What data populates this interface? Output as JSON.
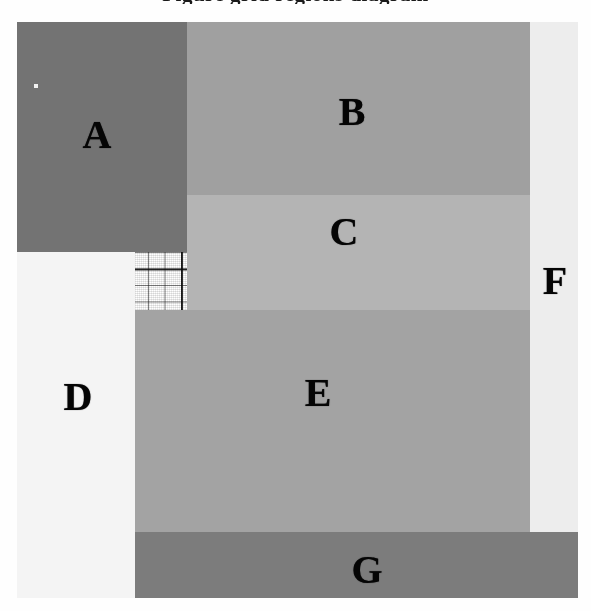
{
  "figure": {
    "clipped_caption_above": "Figure grid regions diagram",
    "plate": {
      "x": 17,
      "y": 22,
      "width": 561,
      "height": 576,
      "grid_cell_px": 16.5,
      "grid_major_every": 5,
      "background": "#ffffff"
    }
  },
  "legend_note": "",
  "chart_data": {
    "type": "heatmap",
    "title": "",
    "xlabel": "",
    "ylabel": "",
    "grid": true,
    "legend_position": "none",
    "xlim": [
      0,
      561
    ],
    "ylim": [
      0,
      576
    ],
    "regions": [
      {
        "label": "A",
        "color": "#737373",
        "x": 0,
        "y": 0,
        "width": 170,
        "height": 230,
        "label_x": 80,
        "label_y": 113,
        "tone": "dark gray"
      },
      {
        "label": "B",
        "color": "#a0a0a0",
        "x": 170,
        "y": 0,
        "width": 343,
        "height": 173,
        "label_x": 335,
        "label_y": 90,
        "tone": "medium gray"
      },
      {
        "label": "C",
        "color": "#b4b4b4",
        "x": 170,
        "y": 173,
        "width": 343,
        "height": 115,
        "label_x": 327,
        "label_y": 210,
        "tone": "light gray"
      },
      {
        "label": "D",
        "color": "#f4f4f4",
        "x": 0,
        "y": 230,
        "width": 118,
        "height": 346,
        "label_x": 61,
        "label_y": 375,
        "tone": "white"
      },
      {
        "label": "E",
        "color": "#a3a3a3",
        "x": 118,
        "y": 288,
        "width": 395,
        "height": 222,
        "label_x": 301,
        "label_y": 371,
        "tone": "medium gray"
      },
      {
        "label": "F",
        "color": "#ededed",
        "x": 513,
        "y": 0,
        "width": 48,
        "height": 510,
        "label_x": 538,
        "label_y": 259,
        "tone": "very light gray"
      },
      {
        "label": "G",
        "color": "#7c7c7c",
        "x": 118,
        "y": 510,
        "width": 443,
        "height": 66,
        "label_x": 350,
        "label_y": 548,
        "tone": "dark gray"
      }
    ],
    "artifacts": [
      {
        "name": "scan-speck",
        "x": 17,
        "y": 62,
        "width": 4,
        "height": 4,
        "color": "#f2f2f2"
      }
    ]
  }
}
